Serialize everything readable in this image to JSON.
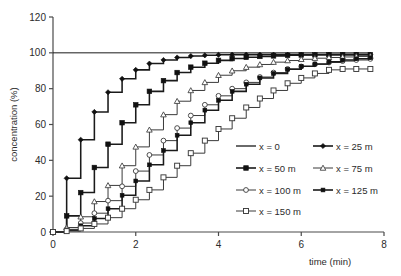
{
  "chart_data": {
    "type": "line",
    "subtype": "step",
    "title": "",
    "xlabel": "time (min)",
    "ylabel": "concentration (%)",
    "xlim": [
      0,
      8
    ],
    "ylim": [
      0,
      120
    ],
    "xticks": [
      0,
      2,
      4,
      6,
      8
    ],
    "yticks": [
      0,
      20,
      40,
      60,
      80,
      100,
      120
    ],
    "grid": false,
    "legend_position": "inside-lower-right",
    "x": [
      0,
      0.33,
      0.67,
      1,
      1.33,
      1.67,
      2,
      2.33,
      2.67,
      3,
      3.33,
      3.67,
      4,
      4.33,
      4.67,
      5,
      5.33,
      5.67,
      6,
      6.33,
      6.67,
      7,
      7.33,
      7.67
    ],
    "series": [
      {
        "name": "x = 0",
        "label": "x = 0",
        "marker": "none",
        "line": "solid",
        "color": "#1a1a1a",
        "values": [
          100,
          100,
          100,
          100,
          100,
          100,
          100,
          100,
          100,
          100,
          100,
          100,
          100,
          100,
          100,
          100,
          100,
          100,
          100,
          100,
          100,
          100,
          100,
          100
        ]
      },
      {
        "name": "x = 25 m",
        "label": "x = 25 m",
        "marker": "filled-diamond",
        "line": "solid",
        "color": "#1a1a1a",
        "values": [
          0,
          30,
          51.5,
          67,
          78,
          85.5,
          90.5,
          94,
          96,
          97.4,
          98.2,
          98.6,
          98.9,
          99,
          99,
          99,
          99,
          99,
          99,
          99,
          99,
          99,
          99,
          99
        ]
      },
      {
        "name": "x = 50 m",
        "label": "x = 50 m",
        "marker": "filled-square",
        "line": "solid",
        "color": "#1a1a1a",
        "values": [
          0,
          9,
          22,
          36,
          49,
          61,
          71,
          78.5,
          84.5,
          89,
          92,
          94.2,
          95.8,
          96.8,
          97.5,
          98,
          98.3,
          98.6,
          98.8,
          98.9,
          99,
          99,
          99,
          99
        ]
      },
      {
        "name": "x = 75 m",
        "label": "x = 75 m",
        "marker": "open-triangle",
        "line": "solid",
        "color": "#3a3a3a",
        "values": [
          0,
          2.5,
          8.5,
          17,
          26,
          37,
          47.5,
          57,
          65.5,
          73,
          79,
          83.5,
          87.5,
          90,
          92,
          93.5,
          94.8,
          95.7,
          96.4,
          97,
          97.4,
          97.7,
          98,
          98.2
        ]
      },
      {
        "name": "x = 100 m",
        "label": "x = 100 m",
        "marker": "open-circle",
        "line": "solid",
        "color": "#3a3a3a",
        "values": [
          0,
          1.5,
          5,
          10.5,
          17.5,
          25.5,
          34,
          43,
          51,
          58,
          65,
          71,
          76,
          80,
          83.5,
          86.5,
          89,
          91,
          92.4,
          93.6,
          94.6,
          95.4,
          96,
          96.6
        ]
      },
      {
        "name": "x = 125 m",
        "label": "x = 125 m",
        "marker": "filled-small",
        "line": "solid",
        "color": "#1a1a1a",
        "values": [
          0,
          1,
          3.5,
          7.5,
          13,
          20.5,
          28.5,
          37.5,
          45.5,
          54,
          61,
          68,
          73.5,
          78.5,
          82.5,
          86,
          88.5,
          90.8,
          92.5,
          93.8,
          95,
          96,
          96.7,
          97.3
        ]
      },
      {
        "name": "x = 150 m",
        "label": "x = 150 m",
        "marker": "open-square",
        "line": "solid",
        "color": "#3a3a3a",
        "values": [
          0,
          0.5,
          2,
          4.5,
          8,
          13,
          18,
          23.5,
          30.5,
          37,
          44,
          51,
          57.5,
          63.5,
          69.5,
          74.5,
          79,
          83,
          86,
          88.5,
          90.5,
          91,
          91,
          91
        ]
      }
    ]
  },
  "legend": {
    "entries": [
      {
        "label": "x = 0"
      },
      {
        "label": "x = 25 m"
      },
      {
        "label": "x = 50 m"
      },
      {
        "label": "x = 75 m"
      },
      {
        "label": "x = 100 m"
      },
      {
        "label": "x = 125 m"
      },
      {
        "label": "x = 150 m"
      }
    ]
  }
}
